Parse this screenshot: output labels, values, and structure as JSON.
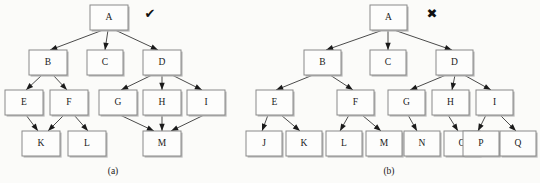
{
  "figure": {
    "background_color": "#fbfbf9",
    "node_fill": "#fdfdfc",
    "node_stroke": "#8a8a8a",
    "edge_color": "#2a2a2a",
    "text_color": "#1a1a1a"
  },
  "panels": [
    {
      "id": "panel-a",
      "caption": "(a)",
      "caption_x": 113,
      "caption_y": 174,
      "mark": {
        "name": "check-mark",
        "glyph": "✔",
        "x": 150,
        "y": 14,
        "color": "#111111"
      },
      "nodes": [
        {
          "id": "A",
          "label": "A",
          "x": 90,
          "y": 5,
          "w": 38,
          "h": 25
        },
        {
          "id": "B",
          "label": "B",
          "x": 29,
          "y": 50,
          "w": 38,
          "h": 25
        },
        {
          "id": "C",
          "label": "C",
          "x": 87,
          "y": 50,
          "w": 36,
          "h": 25
        },
        {
          "id": "D",
          "label": "D",
          "x": 143,
          "y": 50,
          "w": 38,
          "h": 25
        },
        {
          "id": "E",
          "label": "E",
          "x": 5,
          "y": 90,
          "w": 38,
          "h": 25
        },
        {
          "id": "F",
          "label": "F",
          "x": 50,
          "y": 90,
          "w": 38,
          "h": 25
        },
        {
          "id": "G",
          "label": "G",
          "x": 99,
          "y": 90,
          "w": 38,
          "h": 25
        },
        {
          "id": "H",
          "label": "H",
          "x": 143,
          "y": 90,
          "w": 38,
          "h": 25
        },
        {
          "id": "I",
          "label": "I",
          "x": 187,
          "y": 90,
          "w": 38,
          "h": 25
        },
        {
          "id": "K",
          "label": "K",
          "x": 22,
          "y": 131,
          "w": 38,
          "h": 25
        },
        {
          "id": "L",
          "label": "L",
          "x": 68,
          "y": 131,
          "w": 38,
          "h": 25
        },
        {
          "id": "M",
          "label": "M",
          "x": 143,
          "y": 131,
          "w": 38,
          "h": 25
        }
      ],
      "edges": [
        {
          "from": "A",
          "to": "B",
          "x1": 103,
          "y1": 30,
          "x2": 50,
          "y2": 50
        },
        {
          "from": "A",
          "to": "C",
          "x1": 108,
          "y1": 30,
          "x2": 105,
          "y2": 50
        },
        {
          "from": "A",
          "to": "D",
          "x1": 115,
          "y1": 30,
          "x2": 158,
          "y2": 50
        },
        {
          "from": "B",
          "to": "E",
          "x1": 42,
          "y1": 75,
          "x2": 26,
          "y2": 90
        },
        {
          "from": "B",
          "to": "F",
          "x1": 53,
          "y1": 75,
          "x2": 67,
          "y2": 90
        },
        {
          "from": "D",
          "to": "G",
          "x1": 152,
          "y1": 75,
          "x2": 121,
          "y2": 90
        },
        {
          "from": "D",
          "to": "H",
          "x1": 162,
          "y1": 75,
          "x2": 162,
          "y2": 90
        },
        {
          "from": "D",
          "to": "I",
          "x1": 172,
          "y1": 75,
          "x2": 202,
          "y2": 90
        },
        {
          "from": "E",
          "to": "K",
          "x1": 26,
          "y1": 115,
          "x2": 38,
          "y2": 131
        },
        {
          "from": "F",
          "to": "K",
          "x1": 64,
          "y1": 115,
          "x2": 48,
          "y2": 131
        },
        {
          "from": "F",
          "to": "L",
          "x1": 74,
          "y1": 115,
          "x2": 88,
          "y2": 131
        },
        {
          "from": "G",
          "to": "M",
          "x1": 120,
          "y1": 115,
          "x2": 154,
          "y2": 131
        },
        {
          "from": "H",
          "to": "M",
          "x1": 162,
          "y1": 115,
          "x2": 162,
          "y2": 131
        },
        {
          "from": "I",
          "to": "M",
          "x1": 204,
          "y1": 115,
          "x2": 171,
          "y2": 131
        }
      ]
    },
    {
      "id": "panel-b",
      "caption": "(b)",
      "caption_x": 389,
      "caption_y": 174,
      "mark": {
        "name": "cross-mark",
        "glyph": "✖",
        "x": 432,
        "y": 14,
        "color": "#111111"
      },
      "nodes": [
        {
          "id": "A",
          "label": "A",
          "x": 370,
          "y": 5,
          "w": 37,
          "h": 25
        },
        {
          "id": "B",
          "label": "B",
          "x": 304,
          "y": 50,
          "w": 37,
          "h": 25
        },
        {
          "id": "C",
          "label": "C",
          "x": 370,
          "y": 50,
          "w": 36,
          "h": 25
        },
        {
          "id": "D",
          "label": "D",
          "x": 436,
          "y": 50,
          "w": 37,
          "h": 25
        },
        {
          "id": "E",
          "label": "E",
          "x": 256,
          "y": 90,
          "w": 37,
          "h": 25
        },
        {
          "id": "F",
          "label": "F",
          "x": 337,
          "y": 90,
          "w": 37,
          "h": 25
        },
        {
          "id": "G",
          "label": "G",
          "x": 388,
          "y": 90,
          "w": 37,
          "h": 25
        },
        {
          "id": "H",
          "label": "H",
          "x": 432,
          "y": 90,
          "w": 37,
          "h": 25
        },
        {
          "id": "I",
          "label": "I",
          "x": 476,
          "y": 90,
          "w": 37,
          "h": 25
        },
        {
          "id": "J",
          "label": "J",
          "x": 246,
          "y": 131,
          "w": 36,
          "h": 25
        },
        {
          "id": "K",
          "label": "K",
          "x": 286,
          "y": 131,
          "w": 36,
          "h": 25
        },
        {
          "id": "L",
          "label": "L",
          "x": 326,
          "y": 131,
          "w": 36,
          "h": 25
        },
        {
          "id": "M",
          "label": "M",
          "x": 366,
          "y": 131,
          "w": 36,
          "h": 25
        },
        {
          "id": "N",
          "label": "N",
          "x": 404,
          "y": 131,
          "w": 36,
          "h": 25
        },
        {
          "id": "O",
          "label": "O",
          "x": 444,
          "y": 131,
          "w": 36,
          "h": 25
        },
        {
          "id": "P",
          "label": "P",
          "x": 463,
          "y": 131,
          "w": 36,
          "h": 25
        },
        {
          "id": "Q",
          "label": "Q",
          "x": 500,
          "y": 131,
          "w": 36,
          "h": 25
        }
      ],
      "edges": [
        {
          "from": "A",
          "to": "B",
          "x1": 383,
          "y1": 30,
          "x2": 326,
          "y2": 50
        },
        {
          "from": "A",
          "to": "C",
          "x1": 388,
          "y1": 30,
          "x2": 388,
          "y2": 50
        },
        {
          "from": "A",
          "to": "D",
          "x1": 394,
          "y1": 30,
          "x2": 452,
          "y2": 50
        },
        {
          "from": "B",
          "to": "E",
          "x1": 313,
          "y1": 75,
          "x2": 276,
          "y2": 90
        },
        {
          "from": "B",
          "to": "F",
          "x1": 330,
          "y1": 75,
          "x2": 353,
          "y2": 90
        },
        {
          "from": "D",
          "to": "G",
          "x1": 446,
          "y1": 75,
          "x2": 410,
          "y2": 90
        },
        {
          "from": "D",
          "to": "H",
          "x1": 455,
          "y1": 75,
          "x2": 452,
          "y2": 90
        },
        {
          "from": "D",
          "to": "I",
          "x1": 464,
          "y1": 75,
          "x2": 491,
          "y2": 90
        },
        {
          "from": "E",
          "to": "J",
          "x1": 268,
          "y1": 115,
          "x2": 262,
          "y2": 131
        },
        {
          "from": "E",
          "to": "K",
          "x1": 281,
          "y1": 115,
          "x2": 300,
          "y2": 131
        },
        {
          "from": "F",
          "to": "L",
          "x1": 349,
          "y1": 115,
          "x2": 340,
          "y2": 131
        },
        {
          "from": "F",
          "to": "M",
          "x1": 362,
          "y1": 115,
          "x2": 381,
          "y2": 131
        },
        {
          "from": "G",
          "to": "N",
          "x1": 408,
          "y1": 115,
          "x2": 417,
          "y2": 131
        },
        {
          "from": "H",
          "to": "O",
          "x1": 448,
          "y1": 115,
          "x2": 458,
          "y2": 131
        },
        {
          "from": "I",
          "to": "P",
          "x1": 486,
          "y1": 115,
          "x2": 478,
          "y2": 131
        },
        {
          "from": "I",
          "to": "Q",
          "x1": 500,
          "y1": 115,
          "x2": 516,
          "y2": 131
        }
      ]
    }
  ]
}
